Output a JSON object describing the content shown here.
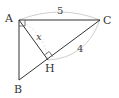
{
  "diagram": {
    "type": "right-triangle-with-altitude",
    "points": {
      "A": {
        "label": "A",
        "x": 19,
        "y": 20
      },
      "B": {
        "label": "B",
        "x": 19,
        "y": 80
      },
      "C": {
        "label": "C",
        "x": 100,
        "y": 20
      },
      "H": {
        "label": "H",
        "x": 48,
        "y": 60
      }
    },
    "measures": {
      "AC": "5",
      "HC": "4",
      "AH": "x"
    },
    "right_angles": [
      "A",
      "H"
    ],
    "colors": {
      "line": "#333333",
      "arc": "#cccccc"
    }
  }
}
